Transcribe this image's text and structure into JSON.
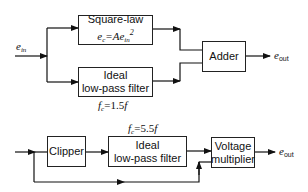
{
  "diagram": {
    "top": {
      "input_label": "e",
      "input_sub": "in",
      "square_law": {
        "title": "Square-law",
        "eq_lhs": "e",
        "eq_lhs_sub": "c",
        "eq_mid": "=Ae",
        "eq_sub": "in",
        "eq_sup": "2"
      },
      "lowpass": {
        "line1": "Ideal",
        "line2": "low-pass filter"
      },
      "lowpass_cutoff": {
        "f": "f",
        "sub": "c",
        "value": "=1.5",
        "f2": "f"
      },
      "adder": "Adder",
      "output_label": "e",
      "output_sub": "out"
    },
    "bottom": {
      "clipper": "Clipper",
      "lowpass": {
        "line1": "Ideal",
        "line2": "low-pass filter"
      },
      "lowpass_cutoff": {
        "f": "f",
        "sub": "c",
        "value": "=5.5",
        "f2": "f"
      },
      "multiplier": {
        "line1": "Voltage",
        "line2": "multiplier"
      },
      "output_label": "e",
      "output_sub": "out"
    }
  }
}
